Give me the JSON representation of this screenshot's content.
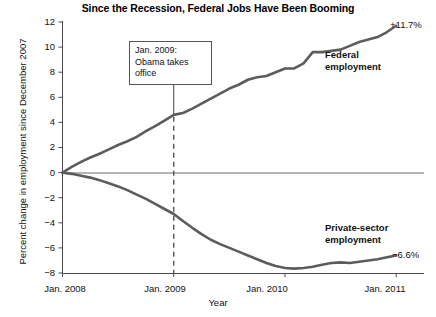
{
  "chart_data": {
    "type": "line",
    "title": "Since the Recession, Federal Jobs Have Been Booming",
    "xlabel": "Year",
    "ylabel": "Percent change in employment since December 2007",
    "ylim": [
      -8,
      12
    ],
    "xlim": [
      2008.0,
      2011.25
    ],
    "yticks": [
      12,
      10,
      8,
      6,
      4,
      2,
      0,
      -2,
      -4,
      -6,
      -8
    ],
    "ytick_labels": [
      "12",
      "10",
      "8",
      "6",
      "4",
      "2",
      "0",
      "−2",
      "−4",
      "−6",
      "−8"
    ],
    "xticks": [
      2008.0,
      2009.0,
      2010.0,
      2011.0
    ],
    "xtick_labels": [
      "Jan. 2008",
      "Jan. 2009",
      "Jan. 2010",
      "Jan. 2011"
    ],
    "grid": false,
    "legend_position": "inline-right",
    "zero_line": 0,
    "series": [
      {
        "name": "Federal employment",
        "color": "#5c5c5c",
        "end_value_label": "+11.7%",
        "x": [
          2008.0,
          2008.083,
          2008.167,
          2008.25,
          2008.333,
          2008.417,
          2008.5,
          2008.583,
          2008.667,
          2008.75,
          2008.833,
          2008.917,
          2009.0,
          2009.083,
          2009.167,
          2009.25,
          2009.333,
          2009.417,
          2009.5,
          2009.583,
          2009.667,
          2009.75,
          2009.833,
          2009.917,
          2010.0,
          2010.083,
          2010.167,
          2010.25,
          2010.333,
          2010.417,
          2010.5,
          2010.583,
          2010.667,
          2010.75,
          2010.833,
          2010.917,
          2011.0
        ],
        "y": [
          0.0,
          0.45,
          0.85,
          1.2,
          1.5,
          1.85,
          2.2,
          2.5,
          2.85,
          3.3,
          3.7,
          4.15,
          4.6,
          4.75,
          5.1,
          5.5,
          5.9,
          6.3,
          6.7,
          7.0,
          7.4,
          7.6,
          7.7,
          8.0,
          8.3,
          8.3,
          8.7,
          9.6,
          9.6,
          9.7,
          9.8,
          10.1,
          10.4,
          10.6,
          10.8,
          11.2,
          11.7
        ]
      },
      {
        "name": "Private-sector employment",
        "color": "#5c5c5c",
        "end_value_label": "−6.6%",
        "x": [
          2008.0,
          2008.083,
          2008.167,
          2008.25,
          2008.333,
          2008.417,
          2008.5,
          2008.583,
          2008.667,
          2008.75,
          2008.833,
          2008.917,
          2009.0,
          2009.083,
          2009.167,
          2009.25,
          2009.333,
          2009.417,
          2009.5,
          2009.583,
          2009.667,
          2009.75,
          2009.833,
          2009.917,
          2010.0,
          2010.083,
          2010.167,
          2010.25,
          2010.333,
          2010.417,
          2010.5,
          2010.583,
          2010.667,
          2010.75,
          2010.833,
          2010.917,
          2011.0
        ],
        "y": [
          0.0,
          -0.1,
          -0.25,
          -0.4,
          -0.6,
          -0.85,
          -1.1,
          -1.4,
          -1.75,
          -2.1,
          -2.5,
          -2.9,
          -3.3,
          -3.85,
          -4.4,
          -4.9,
          -5.35,
          -5.7,
          -6.0,
          -6.3,
          -6.6,
          -6.9,
          -7.2,
          -7.45,
          -7.6,
          -7.65,
          -7.6,
          -7.5,
          -7.35,
          -7.2,
          -7.15,
          -7.2,
          -7.1,
          -7.0,
          -6.9,
          -6.75,
          -6.6
        ]
      }
    ],
    "annotations": [
      {
        "id": "obama-note",
        "lines": [
          "Jan. 2009:",
          "Obama takes",
          "office"
        ],
        "points_to_x": 2009.0,
        "points_to_y": 4.6
      }
    ],
    "reference_lines": [
      {
        "id": "jan-2009-dashed",
        "x": 2009.0,
        "style": "dashed"
      }
    ]
  }
}
